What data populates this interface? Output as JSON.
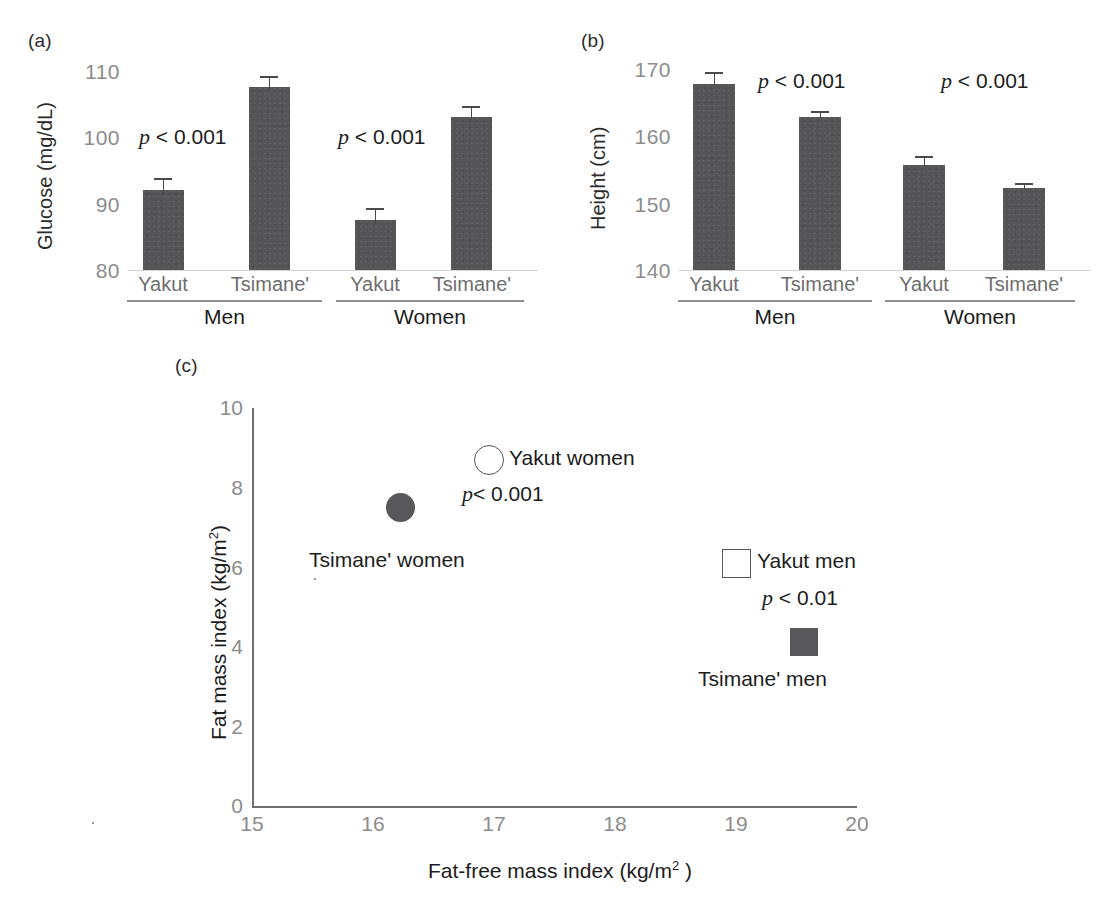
{
  "figure": {
    "panel_a_tag": "(a)",
    "panel_b_tag": "(b)",
    "panel_c_tag": "(c)",
    "bar_color": "#555557",
    "axis_color": "#6f6f6f",
    "tick_label_color": "#8c8c8c"
  },
  "panel_a": {
    "ylabel": "Glucose (mg/dL)",
    "yticks": [
      "110",
      "100",
      "90",
      "80"
    ],
    "categories": [
      "Yakut",
      "Tsimane'",
      "Yakut",
      "Tsimane'"
    ],
    "groups": [
      "Men",
      "Women"
    ],
    "pvalues": [
      "p < 0.001",
      "p < 0.001"
    ]
  },
  "panel_b": {
    "ylabel": "Height (cm)",
    "yticks": [
      "170",
      "160",
      "150",
      "140"
    ],
    "categories": [
      "Yakut",
      "Tsimane'",
      "Yakut",
      "Tsimane'"
    ],
    "groups": [
      "Men",
      "Women"
    ],
    "pvalues": [
      "p < 0.001",
      "p < 0.001"
    ]
  },
  "panel_c": {
    "ylabel_prefix": "Fat mass index (kg/m",
    "ylabel_sup": "2",
    "ylabel_suffix": ")",
    "xlabel_prefix": "Fat-free mass index (kg/m",
    "xlabel_sup": "2",
    "xlabel_suffix": " )",
    "yticks": [
      "10",
      "8",
      "6",
      "4",
      "2",
      "0"
    ],
    "xticks": [
      "15",
      "16",
      "17",
      "18",
      "19",
      "20"
    ],
    "annotations": [
      {
        "text": "Yakut women",
        "marker": "circle-open"
      },
      {
        "text": "p< 0.001",
        "marker": "none"
      },
      {
        "text": "Tsimane' women",
        "marker": "circle-filled"
      },
      {
        "text": "Yakut men",
        "marker": "square-open"
      },
      {
        "text": "p < 0.01",
        "marker": "none"
      },
      {
        "text": "Tsimane' men",
        "marker": "square-filled"
      }
    ],
    "labels": {
      "yakut_women": "Yakut women",
      "tsimane_women": "Tsimane' women",
      "yakut_men": "Yakut men",
      "tsimane_men": "Tsimane' men",
      "p_women": "p< 0.001",
      "p_men": "p < 0.01"
    }
  },
  "chart_data": [
    {
      "type": "bar",
      "panel": "(a)",
      "title": "",
      "xlabel": "",
      "ylabel": "Glucose (mg/dL)",
      "ylim": [
        80,
        110
      ],
      "yticks": [
        80,
        90,
        100,
        110
      ],
      "grid": false,
      "categories": [
        "Men / Yakut",
        "Men / Tsimane'",
        "Women / Yakut",
        "Women / Tsimane'"
      ],
      "values": [
        92.2,
        107.6,
        87.7,
        103.3
      ],
      "errors": [
        1.6,
        0.9,
        1.0,
        0.8
      ],
      "group_labels": [
        "Men",
        "Women"
      ],
      "annotations": [
        "p < 0.001",
        "p < 0.001"
      ]
    },
    {
      "type": "bar",
      "panel": "(b)",
      "title": "",
      "xlabel": "",
      "ylabel": "Height (cm)",
      "ylim": [
        140,
        170
      ],
      "yticks": [
        140,
        150,
        160,
        170
      ],
      "grid": false,
      "categories": [
        "Men / Yakut",
        "Men / Tsimane'",
        "Women / Yakut",
        "Women / Tsimane'"
      ],
      "values": [
        167.8,
        163.0,
        155.7,
        152.3
      ],
      "errors": [
        0.9,
        0.3,
        0.6,
        0.3
      ],
      "group_labels": [
        "Men",
        "Women"
      ],
      "annotations": [
        "p < 0.001",
        "p < 0.001"
      ]
    },
    {
      "type": "scatter",
      "panel": "(c)",
      "title": "",
      "xlabel": "Fat-free mass index (kg/m2 )",
      "ylabel": "Fat mass index (kg/m2)",
      "xlim": [
        15,
        20
      ],
      "ylim": [
        0,
        10
      ],
      "xticks": [
        15,
        16,
        17,
        18,
        19,
        20
      ],
      "yticks": [
        0,
        2,
        4,
        6,
        8,
        10
      ],
      "grid": false,
      "legend_position": "inline-annotations",
      "points": [
        {
          "label": "Tsimane' women",
          "x": 16.2,
          "y": 7.3,
          "marker": "circle-filled"
        },
        {
          "label": "Yakut women",
          "x": 16.95,
          "y": 8.6,
          "marker": "circle-open"
        },
        {
          "label": "Yakut men",
          "x": 19.0,
          "y": 6.0,
          "marker": "square-open"
        },
        {
          "label": "Tsimane' men",
          "x": 19.4,
          "y": 4.1,
          "marker": "square-filled"
        }
      ],
      "annotations": [
        "p< 0.001",
        "p < 0.01"
      ]
    }
  ]
}
